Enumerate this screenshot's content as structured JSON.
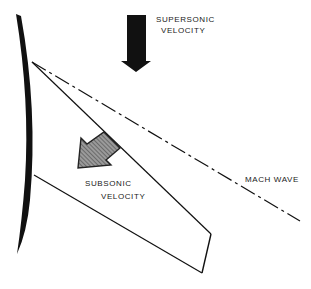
{
  "diagram": {
    "title": "",
    "labels": {
      "supersonic_line1": "SUPERSONIC",
      "supersonic_line2": "VELOCITY",
      "subsonic_line1": "SUBSONIC",
      "subsonic_line2": "VELOCITY",
      "mach_wave": "MACH WAVE"
    },
    "colors": {
      "ink": "#111111",
      "arrow_supersonic": "#111111",
      "arrow_subsonic_fill": "#8a8a8a",
      "arrow_subsonic_hatch": "#3a3a3a",
      "background": "#ffffff"
    },
    "elements": [
      {
        "id": "curved-surface",
        "kind": "thick-curve"
      },
      {
        "id": "supersonic-arrow",
        "kind": "solid-arrow",
        "direction": "down"
      },
      {
        "id": "subsonic-arrow",
        "kind": "hatched-arrow",
        "direction": "down-left"
      },
      {
        "id": "mach-wave-line",
        "kind": "dash-dot-line"
      },
      {
        "id": "oblique-line",
        "kind": "solid-line"
      },
      {
        "id": "lower-line",
        "kind": "solid-line"
      },
      {
        "id": "trailing-edge",
        "kind": "solid-line"
      }
    ]
  }
}
